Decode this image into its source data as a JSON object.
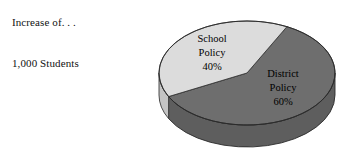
{
  "canvas": {
    "width": 346,
    "height": 152,
    "background": "#ffffff"
  },
  "caption": {
    "line1": "Increase of. . .",
    "line2": "1,000 Students"
  },
  "chart_data": {
    "type": "pie",
    "title": "",
    "subtitle": "",
    "xlabel": "",
    "ylabel": "",
    "legend_position": "none",
    "grid": false,
    "three_d": true,
    "total_label": "1,000 Students",
    "categories": [
      "School Policy",
      "District Policy"
    ],
    "values": [
      40,
      60
    ],
    "units": "percent",
    "slices": [
      {
        "name": "School Policy",
        "label_line1": "School",
        "label_line2": "Policy",
        "label_line3": "40%",
        "value": 40,
        "percent_text": "40%",
        "color": "#dcdcdc",
        "side_color": "#c4c4c4",
        "stroke": "#3a3a3a"
      },
      {
        "name": "District Policy",
        "label_line1": "District",
        "label_line2": "Policy",
        "label_line3": "60%",
        "value": 60,
        "percent_text": "60%",
        "color": "#6e6e6e",
        "side_color": "#5e5e5e",
        "stroke": "#2b2b2b"
      }
    ],
    "colors": {
      "school_policy": "#dcdcdc",
      "district_policy": "#6e6e6e",
      "outline": "#2b2b2b",
      "background": "#ffffff"
    }
  },
  "geometry": {
    "center_x": 247,
    "center_y": 73,
    "radius_x": 88,
    "radius_y": 52,
    "depth": 22,
    "school_label_x": 212,
    "school_label_y": 42,
    "district_label_x": 283,
    "district_label_y": 77
  }
}
